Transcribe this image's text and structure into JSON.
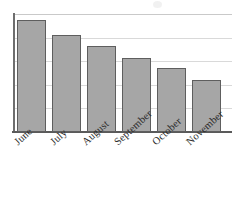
{
  "chart_data": {
    "type": "bar",
    "title": "",
    "subtitle": "",
    "xlabel": "",
    "ylabel": "",
    "categories": [
      "June",
      "July",
      "August",
      "September",
      "October",
      "November"
    ],
    "values": [
      95,
      82,
      73,
      63,
      54,
      44
    ],
    "ylim": [
      0,
      100
    ],
    "grid": true,
    "gridlines": [
      0,
      20,
      40,
      60,
      80,
      100
    ],
    "legend": null,
    "legend_position": "none",
    "tick_labels_x": [
      "June",
      "July",
      "August",
      "September",
      "October",
      "November"
    ],
    "tick_labels_y": [],
    "annotations": [],
    "series": [
      {
        "name": "",
        "values": [
          95,
          82,
          73,
          63,
          54,
          44
        ]
      }
    ]
  },
  "style": {
    "bar_fill": "#a6a6a6",
    "bar_border": "#5e5e5e",
    "gridline_color": "#d9d9d9",
    "axis_color": "#5a5a5a",
    "label_color": "#2b2b2b",
    "background": "#ffffff",
    "label_rotation_deg": -42
  },
  "geometry": {
    "plot_left": 13,
    "plot_top": 14,
    "plot_width": 219,
    "plot_height": 118,
    "bar_width": 29,
    "bar_slot": 35,
    "first_bar_offset": 4,
    "gridline_count": 6
  }
}
